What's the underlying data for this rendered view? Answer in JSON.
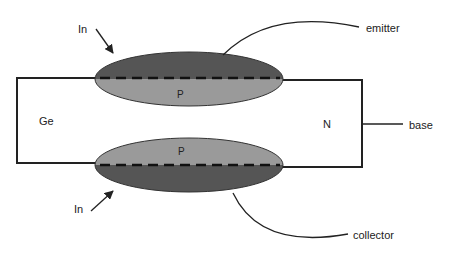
{
  "diagram": {
    "type": "alloy-junction transistor cross-section",
    "labels": {
      "indium_top": "In",
      "indium_bottom": "In",
      "emitter": "emitter",
      "collector": "collector",
      "base": "base",
      "germanium": "Ge",
      "n_region": "N",
      "p_region_top": "P",
      "p_region_bottom": "P"
    },
    "colors": {
      "indium_dark": "#555555",
      "p_region_light": "#9a9a9a",
      "outline": "#222222",
      "background": "#ffffff"
    }
  }
}
